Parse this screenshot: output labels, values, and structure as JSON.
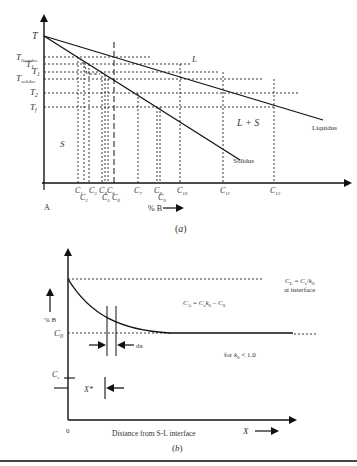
{
  "figure_a": {
    "caption": "(a)",
    "y_axis_label": "T",
    "y_ticks": [
      "T_liquidus",
      "T_1",
      "T_1",
      "T_solidus",
      "T_2",
      "T_f"
    ],
    "y_tick_main": [
      "T",
      "T",
      "T",
      "T",
      "T",
      "T"
    ],
    "y_tick_sub": [
      "liquidus",
      "1",
      "1",
      "solidus",
      "2",
      "f"
    ],
    "x_label": "% B",
    "origin_label": "A",
    "x_ticks": [
      "C1",
      "C2",
      "C3",
      "C4",
      "C5",
      "C6",
      "C0",
      "C7",
      "C8",
      "C9",
      "C10",
      "C11",
      "C12"
    ],
    "x_tick_main": [
      "C",
      "C",
      "C",
      "C",
      "C",
      "C",
      "C",
      "C",
      "C",
      "C",
      "C",
      "C",
      "C"
    ],
    "x_tick_sub": [
      "1",
      "2",
      "3",
      "4",
      "5",
      "6",
      "0",
      "7",
      "8",
      "9",
      "10",
      "11",
      "12"
    ],
    "regions": {
      "liquid": "L",
      "mushy": "L + S",
      "solid": "S"
    },
    "curves": {
      "liquidus": "Liquidus",
      "solidus": "Solidus"
    }
  },
  "figure_b": {
    "caption": "(b)",
    "y_label": "% B",
    "c0_label_main": "C",
    "c0_label_sub": "0",
    "cs_label_main": "C",
    "cs_label_sub": "s",
    "origin_label": "0",
    "x_label": "Distance from S-L interface",
    "x_axis_symbol": "X",
    "dx_label": "dx",
    "x_star_label": "X*",
    "interface_eq": "CL = Cs/k0",
    "interface_note": "at interface",
    "ca_eq": "CA = Cs k0 - C0",
    "condition": "for k0 < 1.0"
  }
}
